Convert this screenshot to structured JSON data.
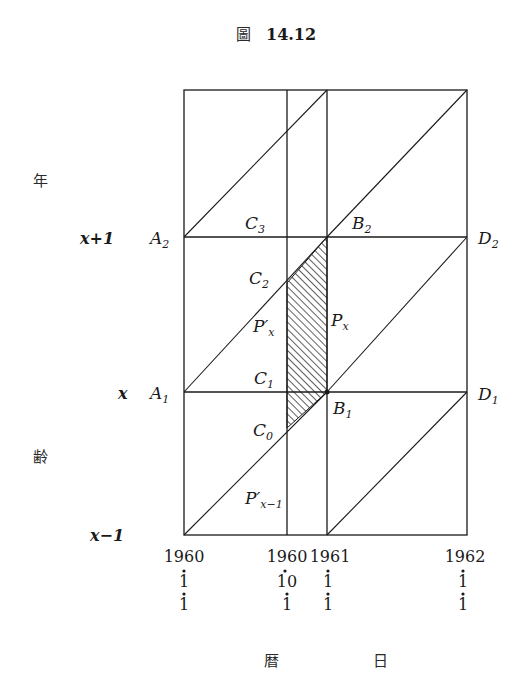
{
  "figure": {
    "title_prefix": "圖",
    "title_number": "14.12"
  },
  "axes": {
    "y_label_top": "年",
    "y_label_bottom": "齢",
    "x_label_left": "暦",
    "x_label_right": "日",
    "y_ticks": [
      {
        "label": "x+1",
        "point": "A",
        "sub": "2"
      },
      {
        "label": "x",
        "point": "A",
        "sub": "1"
      },
      {
        "label": "x−1"
      }
    ],
    "x_ticks": [
      {
        "year": "1960",
        "month": "1",
        "day": "1"
      },
      {
        "year": "1960",
        "month": "10",
        "day": "1"
      },
      {
        "year": "1961",
        "month": "1",
        "day": "1"
      },
      {
        "year": "1962",
        "month": "1",
        "day": "1"
      }
    ]
  },
  "points": {
    "C3": {
      "base": "C",
      "sub": "3"
    },
    "B2": {
      "base": "B",
      "sub": "2"
    },
    "D2": {
      "base": "D",
      "sub": "2"
    },
    "C2": {
      "base": "C",
      "sub": "2"
    },
    "C1": {
      "base": "C",
      "sub": "1"
    },
    "B1": {
      "base": "B",
      "sub": "1"
    },
    "D1": {
      "base": "D",
      "sub": "1"
    },
    "C0": {
      "base": "C",
      "sub": "0"
    }
  },
  "regions": {
    "Px": {
      "base": "P",
      "sub": "x"
    },
    "Ppx": {
      "base": "P′",
      "sub": "x"
    },
    "Ppx1": {
      "base": "P′",
      "sub": "x−1"
    }
  },
  "colors": {
    "line": "#1a1a1a",
    "background": "#ffffff"
  }
}
